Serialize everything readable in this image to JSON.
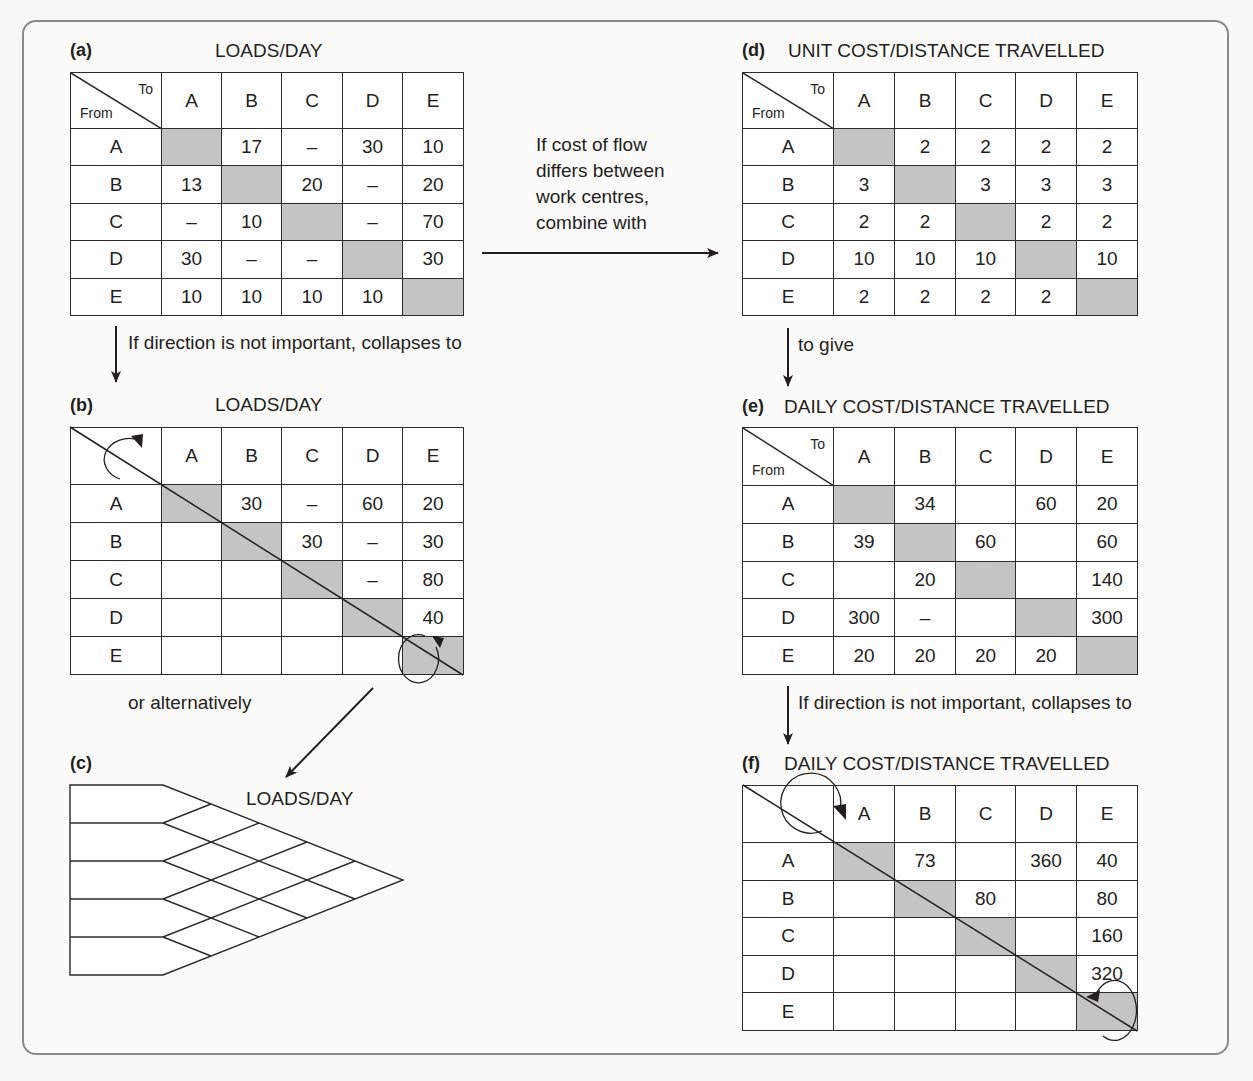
{
  "panels": {
    "a": {
      "letter": "(a)",
      "title": "LOADS/DAY",
      "corner_to": "To",
      "corner_from": "From",
      "columns": [
        "A",
        "B",
        "C",
        "D",
        "E"
      ],
      "rows": [
        {
          "label": "A",
          "cells": [
            "",
            "17",
            "–",
            "30",
            "10"
          ]
        },
        {
          "label": "B",
          "cells": [
            "13",
            "",
            "20",
            "–",
            "20"
          ]
        },
        {
          "label": "C",
          "cells": [
            "–",
            "10",
            "",
            "–",
            "70"
          ]
        },
        {
          "label": "D",
          "cells": [
            "30",
            "–",
            "–",
            "",
            "30"
          ]
        },
        {
          "label": "E",
          "cells": [
            "10",
            "10",
            "10",
            "10",
            ""
          ]
        }
      ]
    },
    "b": {
      "letter": "(b)",
      "title": "LOADS/DAY",
      "columns": [
        "A",
        "B",
        "C",
        "D",
        "E"
      ],
      "rows": [
        {
          "label": "A",
          "cells": [
            "",
            "30",
            "–",
            "60",
            "20"
          ]
        },
        {
          "label": "B",
          "cells": [
            "",
            "",
            "30",
            "–",
            "30"
          ]
        },
        {
          "label": "C",
          "cells": [
            "",
            "",
            "",
            "–",
            "80"
          ]
        },
        {
          "label": "D",
          "cells": [
            "",
            "",
            "",
            "",
            "40"
          ]
        },
        {
          "label": "E",
          "cells": [
            "",
            "",
            "",
            "",
            ""
          ]
        }
      ]
    },
    "c": {
      "letter": "(c)",
      "title": "LOADS/DAY",
      "rows": [
        "A",
        "B",
        "C",
        "D",
        "E"
      ],
      "pairs": {
        "AB": "30",
        "BC": "30",
        "CD": "–",
        "DE": "40",
        "AC": "–",
        "BD": "–",
        "CE": "80",
        "AD": "60",
        "BE": "30",
        "AE": "20"
      }
    },
    "d": {
      "letter": "(d)",
      "title": "UNIT COST/DISTANCE TRAVELLED",
      "corner_to": "To",
      "corner_from": "From",
      "columns": [
        "A",
        "B",
        "C",
        "D",
        "E"
      ],
      "rows": [
        {
          "label": "A",
          "cells": [
            "",
            "2",
            "2",
            "2",
            "2"
          ]
        },
        {
          "label": "B",
          "cells": [
            "3",
            "",
            "3",
            "3",
            "3"
          ]
        },
        {
          "label": "C",
          "cells": [
            "2",
            "2",
            "",
            "2",
            "2"
          ]
        },
        {
          "label": "D",
          "cells": [
            "10",
            "10",
            "10",
            "",
            "10"
          ]
        },
        {
          "label": "E",
          "cells": [
            "2",
            "2",
            "2",
            "2",
            ""
          ]
        }
      ]
    },
    "e": {
      "letter": "(e)",
      "title": "DAILY COST/DISTANCE TRAVELLED",
      "corner_to": "To",
      "corner_from": "From",
      "columns": [
        "A",
        "B",
        "C",
        "D",
        "E"
      ],
      "rows": [
        {
          "label": "A",
          "cells": [
            "",
            "34",
            "",
            "60",
            "20"
          ]
        },
        {
          "label": "B",
          "cells": [
            "39",
            "",
            "60",
            "",
            "60"
          ]
        },
        {
          "label": "C",
          "cells": [
            "",
            "20",
            "",
            "",
            "140"
          ]
        },
        {
          "label": "D",
          "cells": [
            "300",
            "–",
            "",
            "",
            "300"
          ]
        },
        {
          "label": "E",
          "cells": [
            "20",
            "20",
            "20",
            "20",
            ""
          ]
        }
      ]
    },
    "f": {
      "letter": "(f)",
      "title": "DAILY COST/DISTANCE TRAVELLED",
      "columns": [
        "A",
        "B",
        "C",
        "D",
        "E"
      ],
      "rows": [
        {
          "label": "A",
          "cells": [
            "",
            "73",
            "",
            "360",
            "40"
          ]
        },
        {
          "label": "B",
          "cells": [
            "",
            "",
            "80",
            "",
            "80"
          ]
        },
        {
          "label": "C",
          "cells": [
            "",
            "",
            "",
            "",
            "160"
          ]
        },
        {
          "label": "D",
          "cells": [
            "",
            "",
            "",
            "",
            "320"
          ]
        },
        {
          "label": "E",
          "cells": [
            "",
            "",
            "",
            "",
            ""
          ]
        }
      ]
    }
  },
  "notes": {
    "a_to_b": "If direction is not important, collapses to",
    "a_to_d": [
      "If cost of flow",
      "differs between",
      "work centres,",
      "combine with"
    ],
    "b_to_c": "or alternatively",
    "d_to_e": "to give",
    "e_to_f": "If direction is not important, collapses to"
  },
  "colors": {
    "shaded_cell": "#c4c4c4",
    "line": "#2b2b2b",
    "frame_border": "#8a8a8a"
  }
}
